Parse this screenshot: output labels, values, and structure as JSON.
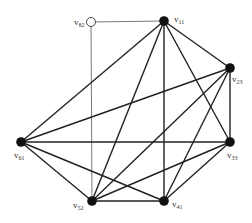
{
  "diagram": {
    "type": "graph",
    "nodes": [
      {
        "id": "v82",
        "label": "v",
        "sub": "82",
        "x": 91,
        "y": 22,
        "style": "open",
        "lx": 74,
        "ly": 25
      },
      {
        "id": "v11",
        "label": "v",
        "sub": "11",
        "x": 164,
        "y": 21,
        "style": "filled",
        "lx": 174,
        "ly": 22
      },
      {
        "id": "v23",
        "label": "v",
        "sub": "23",
        "x": 230,
        "y": 68,
        "style": "filled",
        "lx": 232,
        "ly": 82
      },
      {
        "id": "v61",
        "label": "v",
        "sub": "61",
        "x": 21,
        "y": 142,
        "style": "filled",
        "lx": 14,
        "ly": 158
      },
      {
        "id": "v33",
        "label": "v",
        "sub": "33",
        "x": 230,
        "y": 142,
        "style": "filled",
        "lx": 227,
        "ly": 158
      },
      {
        "id": "v52",
        "label": "v",
        "sub": "52",
        "x": 92,
        "y": 201,
        "style": "filled",
        "lx": 73,
        "ly": 208
      },
      {
        "id": "v41",
        "label": "v",
        "sub": "41",
        "x": 164,
        "y": 201,
        "style": "filled",
        "lx": 172,
        "ly": 207
      }
    ],
    "edges": [
      {
        "from": "v82",
        "to": "v11",
        "style": "thin"
      },
      {
        "from": "v82",
        "to": "v52",
        "style": "thin"
      },
      {
        "from": "v11",
        "to": "v61",
        "style": "bold"
      },
      {
        "from": "v11",
        "to": "v52",
        "style": "bold"
      },
      {
        "from": "v11",
        "to": "v41",
        "style": "bold"
      },
      {
        "from": "v11",
        "to": "v23",
        "style": "bold"
      },
      {
        "from": "v11",
        "to": "v33",
        "style": "bold"
      },
      {
        "from": "v23",
        "to": "v61",
        "style": "bold"
      },
      {
        "from": "v23",
        "to": "v33",
        "style": "bold"
      },
      {
        "from": "v23",
        "to": "v52",
        "style": "bold"
      },
      {
        "from": "v23",
        "to": "v41",
        "style": "bold"
      },
      {
        "from": "v61",
        "to": "v33",
        "style": "bold"
      },
      {
        "from": "v61",
        "to": "v52",
        "style": "bold"
      },
      {
        "from": "v61",
        "to": "v41",
        "style": "bold"
      },
      {
        "from": "v33",
        "to": "v52",
        "style": "bold"
      },
      {
        "from": "v33",
        "to": "v41",
        "style": "bold"
      },
      {
        "from": "v52",
        "to": "v41",
        "style": "bold"
      }
    ]
  }
}
